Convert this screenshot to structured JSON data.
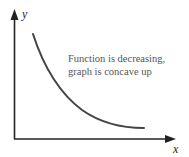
{
  "diagram": {
    "axes": {
      "x_label": "x",
      "y_label": "y"
    },
    "annotation": {
      "line1": "Function is decreasing,",
      "line2": "graph is concave up"
    },
    "curve": {
      "description": "decreasing, concave up curve",
      "color": "#444444"
    },
    "colors": {
      "axis": "#222222",
      "text": "#555555",
      "background": "#ffffff"
    }
  }
}
